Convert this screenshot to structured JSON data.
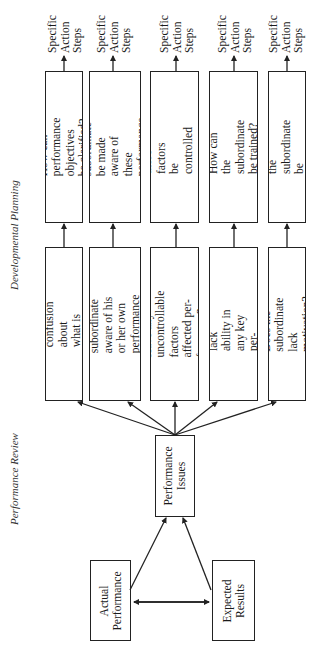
{
  "section_labels": {
    "developmental_planning": "Developmental Planning",
    "performance_review": "Performance Review"
  },
  "inputs": {
    "actual_performance": "Actual\nPerformance",
    "expected_results": "Expected\nResults"
  },
  "hub": {
    "performance_issues": "Performance\nIssues"
  },
  "review_questions": [
    "Is there confusion about\nwhat is expected?",
    "Is the subordinate\naware of his or her own\nperformance problems?",
    "Have any uncontrollable\nfactors affected per-\nformance?",
    "Does the subordinate lack\nability in any key per-\nformance areas?",
    "Does the subordinate\nlack motivation?"
  ],
  "planning_questions": [
    "How can performance\nobjectives be clarified?",
    "How can the subordinate\nbe made aware of these\nperformance problems?",
    "How can these factors\nbe controlled or\neliminated?",
    "How can the subordinate\nbe trained?",
    "How can the subordinate\nbe motivated?"
  ],
  "outcomes": [
    "Specific\nAction\nSteps",
    "Specific\nAction\nSteps",
    "Specific\nAction\nSteps",
    "Specific\nAction\nSteps",
    "Specific\nAction\nSteps"
  ]
}
